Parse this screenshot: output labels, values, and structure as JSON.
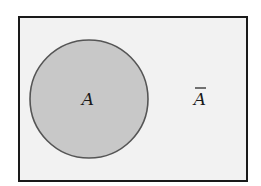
{
  "diagram": {
    "type": "venn",
    "universe": {
      "fill": "#f2f2f2",
      "stroke": "#1a1a1a"
    },
    "set_a": {
      "label": "A",
      "fill": "#c8c8c8",
      "stroke": "#555555"
    },
    "complement": {
      "label": "A",
      "overbar": true
    }
  }
}
